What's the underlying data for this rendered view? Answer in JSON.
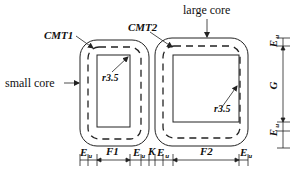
{
  "labels": {
    "cmt1": "CMT1",
    "cmt2": "CMT2",
    "large_core": "large core",
    "small_core": "small core",
    "radius_small": "r3.5",
    "radius_large": "r3.5"
  },
  "dimensions": {
    "bottom": [
      {
        "symbol": "E",
        "sub": "u"
      },
      {
        "symbol": "F1",
        "sub": ""
      },
      {
        "symbol": "E",
        "sub": "u"
      },
      {
        "symbol": "K",
        "sub": ""
      },
      {
        "symbol": "E",
        "sub": "u"
      },
      {
        "symbol": "F2",
        "sub": ""
      },
      {
        "symbol": "E",
        "sub": "u"
      }
    ],
    "right": [
      {
        "symbol": "E",
        "sub": "u"
      },
      {
        "symbol": "G",
        "sub": ""
      },
      {
        "symbol": "E",
        "sub": "u"
      }
    ]
  },
  "colors": {
    "stroke": "#222222",
    "background": "#ffffff"
  }
}
